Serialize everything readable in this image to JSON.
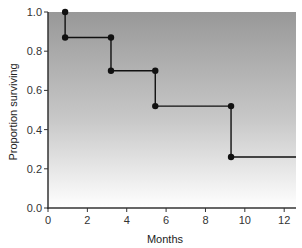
{
  "chart_data": {
    "type": "line",
    "subtype": "kaplan-meier step",
    "title": "",
    "xlabel": "Months",
    "ylabel": "Proportion surviving",
    "xlim": [
      0,
      12.6
    ],
    "ylim": [
      0,
      1.0
    ],
    "x_ticks": [
      0,
      2,
      4,
      6,
      8,
      10,
      12
    ],
    "x_tick_labels": [
      "0",
      "2",
      "4",
      "6",
      "8",
      "10",
      "12"
    ],
    "y_ticks": [
      0.0,
      0.2,
      0.4,
      0.6,
      0.8,
      1.0
    ],
    "y_tick_labels": [
      "0.0",
      "0.2",
      "0.4",
      "0.6",
      "0.8",
      "1.0"
    ],
    "grid": false,
    "legend": null,
    "background": "vertical gradient, grey (#9a9a9a) top to white bottom",
    "series": [
      {
        "name": "Survival",
        "color": "#111111",
        "steps": [
          {
            "x": 0.87,
            "from": 1.0,
            "to": 0.87
          },
          {
            "x": 3.2,
            "from": 0.87,
            "to": 0.7
          },
          {
            "x": 5.45,
            "from": 0.7,
            "to": 0.52
          },
          {
            "x": 9.3,
            "from": 0.52,
            "to": 0.26
          }
        ],
        "end_x": 12.6,
        "points": [
          {
            "x": 0.87,
            "y": 1.0
          },
          {
            "x": 0.87,
            "y": 0.87
          },
          {
            "x": 3.2,
            "y": 0.87
          },
          {
            "x": 3.2,
            "y": 0.7
          },
          {
            "x": 5.45,
            "y": 0.7
          },
          {
            "x": 5.45,
            "y": 0.52
          },
          {
            "x": 9.3,
            "y": 0.52
          },
          {
            "x": 9.3,
            "y": 0.26
          }
        ]
      }
    ]
  }
}
